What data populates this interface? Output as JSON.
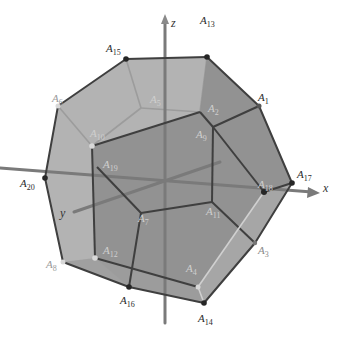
{
  "figure": {
    "colors": {
      "background": "#ffffff",
      "back_face": "#b0b0b0",
      "side_face": "#a3a3a3",
      "front_face": "#8a8a8a",
      "edge_front": "#3d3d3d",
      "edge_back": "#8c8c8c",
      "axis": "#7a7a7a",
      "vertex_dark": "#262626",
      "vertex_light": "#d8d8d8"
    }
  },
  "axes": {
    "x": {
      "label": "x"
    },
    "y": {
      "label": "y"
    },
    "z": {
      "label": "z"
    }
  },
  "vertices": [
    {
      "name": "A",
      "sub": "15",
      "x": 126,
      "y": 59,
      "lx": 106,
      "ly": 52,
      "visible": true
    },
    {
      "name": "A",
      "sub": "13",
      "x": 207,
      "y": 57,
      "lx": 200,
      "ly": 24,
      "visible": true
    },
    {
      "name": "A",
      "sub": "1",
      "x": 259,
      "y": 106,
      "lx": 258,
      "ly": 101,
      "visible": true
    },
    {
      "name": "A",
      "sub": "17",
      "x": 292,
      "y": 183,
      "lx": 297,
      "ly": 178,
      "visible": true
    },
    {
      "name": "A",
      "sub": "18",
      "x": 264,
      "y": 192,
      "lx": 258,
      "ly": 188,
      "visible": false
    },
    {
      "name": "A",
      "sub": "3",
      "x": 255,
      "y": 243,
      "lx": 258,
      "ly": 254,
      "visible": true
    },
    {
      "name": "A",
      "sub": "14",
      "x": 204,
      "y": 303,
      "lx": 198,
      "ly": 322,
      "visible": true
    },
    {
      "name": "A",
      "sub": "16",
      "x": 129,
      "y": 287,
      "lx": 120,
      "ly": 304,
      "visible": true
    },
    {
      "name": "A",
      "sub": "8",
      "x": 63,
      "y": 262,
      "lx": 46,
      "ly": 268,
      "visible": true
    },
    {
      "name": "A",
      "sub": "20",
      "x": 45,
      "y": 178,
      "lx": 20,
      "ly": 187,
      "visible": true
    },
    {
      "name": "A",
      "sub": "6",
      "x": 58,
      "y": 106,
      "lx": 52,
      "ly": 102,
      "visible": true
    },
    {
      "name": "A",
      "sub": "10",
      "x": 92,
      "y": 146,
      "lx": 90,
      "ly": 137,
      "visible": false
    },
    {
      "name": "A",
      "sub": "19",
      "x": 97,
      "y": 167,
      "lx": 103,
      "ly": 168,
      "visible": false
    },
    {
      "name": "A",
      "sub": "12",
      "x": 95,
      "y": 258,
      "lx": 103,
      "ly": 254,
      "visible": false
    },
    {
      "name": "A",
      "sub": "2",
      "x": 200,
      "y": 112,
      "lx": 208,
      "ly": 112,
      "visible": false
    },
    {
      "name": "A",
      "sub": "9",
      "x": 213,
      "y": 127,
      "lx": 196,
      "ly": 138,
      "visible": false
    },
    {
      "name": "A",
      "sub": "11",
      "x": 212,
      "y": 202,
      "lx": 206,
      "ly": 215,
      "visible": false
    },
    {
      "name": "A",
      "sub": "5",
      "x": 141,
      "y": 108,
      "lx": 150,
      "ly": 103,
      "visible": false
    },
    {
      "name": "A",
      "sub": "7",
      "x": 141,
      "y": 213,
      "lx": 138,
      "ly": 222,
      "visible": false
    },
    {
      "name": "A",
      "sub": "4",
      "x": 198,
      "y": 287,
      "lx": 186,
      "ly": 272,
      "visible": false
    }
  ]
}
